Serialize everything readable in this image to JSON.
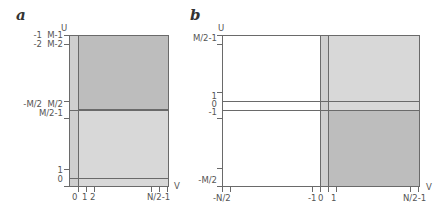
{
  "colors": {
    "dark_grey": "#bdbdbd",
    "light_grey": "#d8d8d8",
    "line": "#6a6a6a",
    "white": "#ffffff"
  },
  "panel_a": {
    "letter": "a",
    "axis_u": "U",
    "axis_v": "V",
    "left_labels_outer": {
      "neg1": "-1",
      "neg2": "-2",
      "negM2": "-M/2"
    },
    "left_labels_inner": {
      "M1": "M-1",
      "M2": "M-2",
      "Mhalf": "M/2",
      "Mhalf1": "M/2-1",
      "one": "1",
      "zero": "0"
    },
    "bottom_labels": {
      "zero": "0",
      "one": "1",
      "two": "2",
      "Nhalf1": "N/2-1"
    }
  },
  "panel_b": {
    "letter": "b",
    "axis_u": "U",
    "axis_v": "V",
    "left_labels": {
      "Mhalf1": "M/2-1",
      "one": "1",
      "zero": "0",
      "neg1": "-1",
      "negMhalf": "-M/2"
    },
    "bottom_labels": {
      "negNhalf": "-N/2",
      "neg1": "-1",
      "zero": "0",
      "one": "1",
      "Nhalf1": "N/2-1"
    }
  }
}
